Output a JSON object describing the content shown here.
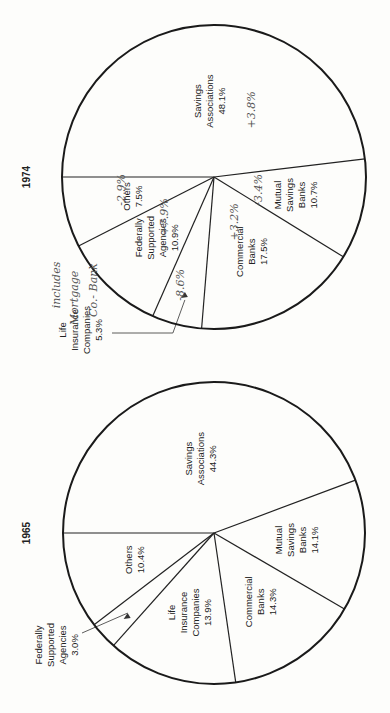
{
  "chart_data": [
    {
      "type": "pie",
      "title": "1974",
      "orientation": "rotated 90deg (text reads bottom-to-top)",
      "categories": [
        "Savings Associations",
        "Mutual Savings Banks",
        "Commercial Banks",
        "Life Insurance Companies",
        "Federally Supported Agencies",
        "Others"
      ],
      "values": [
        48.1,
        10.7,
        17.5,
        5.3,
        10.9,
        7.5
      ],
      "labels": [
        "Savings Associations 48.1%",
        "Mutual Savings Banks 10.7%",
        "Commercial Banks 17.5%",
        "Life Insurance Companies 5.3%",
        "Federally Supported Agencies 10.9%",
        "Others 7.5%"
      ],
      "handwritten_annotations": [
        "+3.8%",
        "-3.4%",
        "+3.2%",
        "-8.6%",
        "+7.9%",
        "-2.9%",
        "includes Mortgage Co.- Bank"
      ]
    },
    {
      "type": "pie",
      "title": "1965",
      "orientation": "rotated 90deg (text reads bottom-to-top)",
      "categories": [
        "Savings Associations",
        "Mutual Savings Banks",
        "Commercial Banks",
        "Life Insurance Companies",
        "Federally Supported Agencies",
        "Others"
      ],
      "values": [
        44.3,
        14.1,
        14.3,
        13.9,
        3.0,
        10.4
      ],
      "labels": [
        "Savings Associations 44.3%",
        "Mutual Savings Banks 14.1%",
        "Commercial Banks 14.3%",
        "Life Insurance Companies 13.9%",
        "Federally Supported Agencies 3.0%",
        "Others 10.4%"
      ]
    }
  ],
  "pies": [
    {
      "year": "1974",
      "cx": 214,
      "cy": 177,
      "r": 152,
      "slices": [
        {
          "name": "Savings Associations",
          "lines": [
            "Savings",
            "Associations",
            "48.1%"
          ],
          "value": 48.1
        },
        {
          "name": "Mutual Savings Banks",
          "lines": [
            "Mutual",
            "Savings",
            "Banks",
            "10.7%"
          ],
          "value": 10.7
        },
        {
          "name": "Commercial Banks",
          "lines": [
            "Commercial",
            "Banks",
            "17.5%"
          ],
          "value": 17.5
        },
        {
          "name": "Life Insurance Companies",
          "lines": [
            "Life",
            "Insurance",
            "Companies",
            "5.3%"
          ],
          "value": 5.3,
          "external": true
        },
        {
          "name": "Federally Supported Agencies",
          "lines": [
            "Federally",
            "Supported",
            "Agencies",
            "10.9%"
          ],
          "value": 10.9
        },
        {
          "name": "Others",
          "lines": [
            "Others",
            "7.5%"
          ],
          "value": 7.5
        }
      ],
      "notes": [
        {
          "text": "+3.8%",
          "x": 255,
          "y": 110
        },
        {
          "text": "-3.4%",
          "x": 262,
          "y": 190
        },
        {
          "text": "+3.2%",
          "x": 238,
          "y": 222
        },
        {
          "text": "-8.6%",
          "x": 184,
          "y": 285
        },
        {
          "text": "+7.9%",
          "x": 168,
          "y": 217
        },
        {
          "text": "-2.9%",
          "x": 125,
          "y": 190
        },
        {
          "text": "includes",
          "x": 60,
          "y": 285
        },
        {
          "text": "Mortgage",
          "x": 78,
          "y": 298
        },
        {
          "text": "Co.- Bank",
          "x": 97,
          "y": 290
        }
      ]
    },
    {
      "year": "1965",
      "cx": 214,
      "cy": 533,
      "r": 151,
      "slices": [
        {
          "name": "Savings Associations",
          "lines": [
            "Savings",
            "Associations",
            "44.3%"
          ],
          "value": 44.3
        },
        {
          "name": "Mutual Savings Banks",
          "lines": [
            "Mutual",
            "Savings",
            "Banks",
            "14.1%"
          ],
          "value": 14.1
        },
        {
          "name": "Commercial Banks",
          "lines": [
            "Commercial",
            "Banks",
            "14.3%"
          ],
          "value": 14.3
        },
        {
          "name": "Life Insurance Companies",
          "lines": [
            "Life",
            "Insurance",
            "Companies",
            "13.9%"
          ],
          "value": 13.9
        },
        {
          "name": "Federally Supported Agencies",
          "lines": [
            "Federally",
            "Supported",
            "Agencies",
            "3.0%"
          ],
          "value": 3.0,
          "external": true
        },
        {
          "name": "Others",
          "lines": [
            "Others",
            "10.4%"
          ],
          "value": 10.4
        }
      ],
      "notes": []
    }
  ]
}
